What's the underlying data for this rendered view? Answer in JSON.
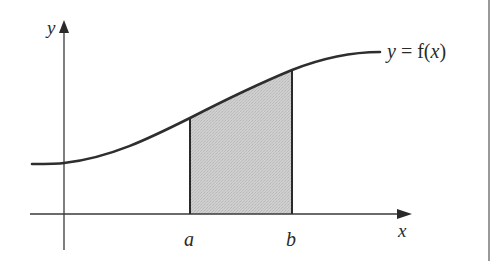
{
  "diagram": {
    "type": "definite-integral-area",
    "axes": {
      "x_label": "x",
      "y_label": "y"
    },
    "curve": {
      "label": "y = f(x)",
      "label_parts": [
        "y",
        " = f(",
        "x",
        ")"
      ]
    },
    "bounds": {
      "lower": "a",
      "upper": "b"
    },
    "colors": {
      "line": "#2a2a2a",
      "curve": "#2e2e2e",
      "shade": "#c8c8c8",
      "background": "#ffffff",
      "border": "#555555"
    }
  }
}
